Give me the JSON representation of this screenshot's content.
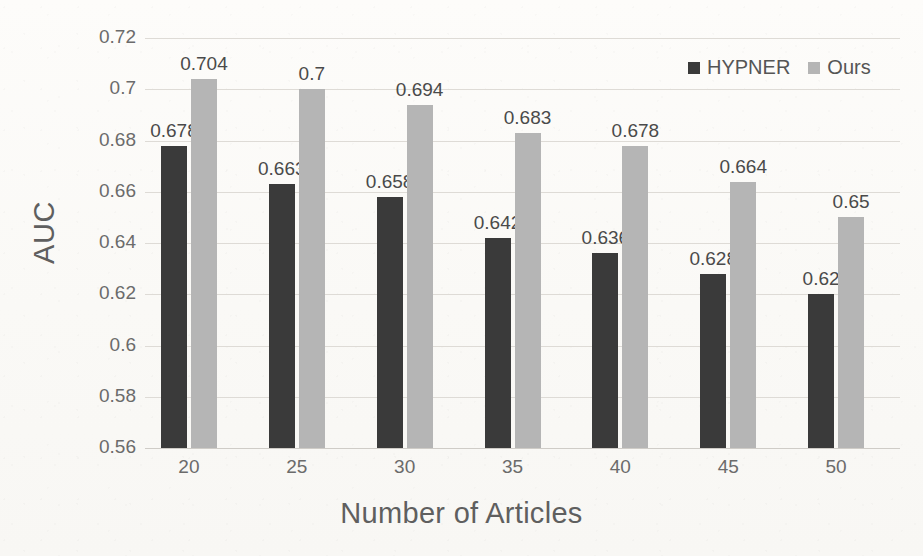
{
  "chart_data": {
    "type": "bar",
    "title": "",
    "xlabel": "Number of Articles",
    "ylabel": "AUC",
    "categories": [
      "20",
      "25",
      "30",
      "35",
      "40",
      "45",
      "50"
    ],
    "series": [
      {
        "name": "HYPNER",
        "color": "#3a3a3a",
        "values": [
          0.678,
          0.663,
          0.658,
          0.642,
          0.636,
          0.628,
          0.62
        ],
        "labels": [
          "0.678",
          "0.663",
          "0.658",
          "0.642",
          "0.636",
          "0.628",
          "0.62"
        ]
      },
      {
        "name": "Ours",
        "color": "#b5b5b5",
        "values": [
          0.704,
          0.7,
          0.694,
          0.683,
          0.678,
          0.664,
          0.65
        ],
        "labels": [
          "0.704",
          "0.7",
          "0.694",
          "0.683",
          "0.678",
          "0.664",
          "0.65"
        ]
      }
    ],
    "ylim": [
      0.56,
      0.72
    ],
    "ytick_values": [
      0.72,
      0.7,
      0.68,
      0.66,
      0.64,
      0.62,
      0.6,
      0.58,
      0.56
    ],
    "ytick_labels": [
      "0.72",
      "0.7",
      "0.68",
      "0.66",
      "0.64",
      "0.62",
      "0.6",
      "0.58",
      "0.56"
    ],
    "grid": true,
    "legend_position": "top-right"
  },
  "legend": {
    "items": [
      {
        "label": "HYPNER",
        "color": "#3a3a3a",
        "marker": "square-marker"
      },
      {
        "label": "Ours",
        "color": "#b5b5b5",
        "marker": "square-marker"
      }
    ]
  },
  "axes": {
    "y_title": "AUC",
    "x_title": "Number of Articles"
  }
}
